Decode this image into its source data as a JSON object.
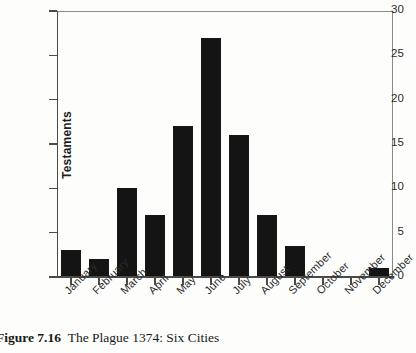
{
  "figure": {
    "caption_label": "Figure 7.16",
    "caption_text": "The Plague 1374: Six Cities"
  },
  "colors": {
    "bar": "#141414",
    "axis": "#4a4a4a",
    "frame": "#7a7a7a",
    "background": "#fdfdfb",
    "text": "#1f1f1f"
  },
  "chart_data": {
    "type": "bar",
    "title": "",
    "subtitle": "",
    "xlabel": "",
    "ylabel": "Testaments",
    "categories": [
      "January",
      "February",
      "March",
      "April",
      "May",
      "June",
      "July",
      "August",
      "September",
      "October",
      "November",
      "December"
    ],
    "values": [
      3,
      2,
      10,
      7,
      17,
      27,
      16,
      7,
      3.5,
      0,
      0,
      1
    ],
    "ylim": [
      0,
      30
    ],
    "yticks": [
      0,
      5,
      10,
      15,
      20,
      25,
      30
    ],
    "ytick_labels": [
      "0",
      "5",
      "10",
      "15",
      "20",
      "25",
      "30"
    ],
    "grid": false,
    "legend": false,
    "legend_position": "none",
    "xtick_label_rotation": -45,
    "annotations": []
  }
}
